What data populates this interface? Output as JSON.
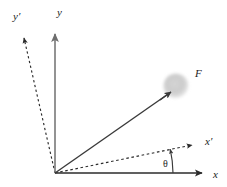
{
  "figure": {
    "kind": "vector-diagram",
    "background_color": "#ffffff",
    "width": 227,
    "height": 187,
    "origin": {
      "x": 55,
      "y": 173
    }
  },
  "labels": {
    "y_axis": "y",
    "y_prime_axis": "y′",
    "x_axis": "x",
    "x_prime_axis": "x′",
    "force_vector": "F",
    "angle": "θ"
  },
  "colors": {
    "y_axis_line": "#808080",
    "x_axis_line": "#2b2b2b",
    "dashed_line": "#2b2b2b",
    "force_vector": "#3a3a3a",
    "arc": "#3a3a3a",
    "ball_fill": "#c9c9c9",
    "text": "#1c1c1c"
  },
  "geometry": {
    "y_axis": {
      "x1": 55,
      "y1": 173,
      "x2": 55,
      "y2": 34
    },
    "y_prime_axis": {
      "x1": 55,
      "y1": 173,
      "x2": 24,
      "y2": 38
    },
    "x_axis": {
      "x1": 55,
      "y1": 173,
      "x2": 202,
      "y2": 173
    },
    "x_prime_axis": {
      "x1": 55,
      "y1": 173,
      "x2": 192,
      "y2": 145
    },
    "force_vector": {
      "x1": 55,
      "y1": 173,
      "x2": 171,
      "y2": 92
    },
    "ball": {
      "cx": 176,
      "cy": 86,
      "r": 13
    },
    "angle_arc": {
      "cx": 55,
      "cy": 173,
      "radius": 118,
      "start_deg": 0,
      "end_deg": 11.5
    }
  },
  "label_positions": {
    "y_axis": {
      "x": 57,
      "y": 16
    },
    "y_prime_axis": {
      "x": 13,
      "y": 20
    },
    "x_axis": {
      "x": 213,
      "y": 178
    },
    "x_prime_axis": {
      "x": 206,
      "y": 145
    },
    "force_vector": {
      "x": 195,
      "y": 77
    },
    "angle": {
      "x": 163,
      "y": 167
    }
  }
}
